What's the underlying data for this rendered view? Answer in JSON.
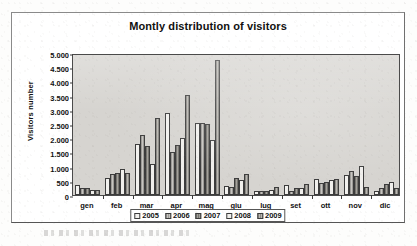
{
  "chart_data": {
    "type": "bar",
    "title": "Montly distribution of visitors",
    "xlabel": "",
    "ylabel": "Visitors number",
    "ylim": [
      0,
      5000
    ],
    "ytick_labels": [
      "0",
      "500",
      "1.000",
      "1.500",
      "2.000",
      "2.500",
      "3.000",
      "3.500",
      "4.000",
      "4.500",
      "5.000"
    ],
    "ytick_values": [
      0,
      500,
      1000,
      1500,
      2000,
      2500,
      3000,
      3500,
      4000,
      4500,
      5000
    ],
    "grid": false,
    "legend_position": "bottom",
    "categories": [
      "gen",
      "feb",
      "mar",
      "apr",
      "mag",
      "giu",
      "lug",
      "set",
      "ott",
      "nov",
      "dic"
    ],
    "series": [
      {
        "name": "2005",
        "values": [
          350,
          610,
          1800,
          2880,
          2530,
          300,
          140,
          340,
          570,
          690,
          150
        ]
      },
      {
        "name": "2006",
        "values": [
          250,
          730,
          2110,
          1530,
          2540,
          270,
          130,
          150,
          410,
          860,
          240
        ]
      },
      {
        "name": "2007",
        "values": [
          260,
          790,
          1710,
          1760,
          2490,
          590,
          140,
          230,
          470,
          670,
          390
        ]
      },
      {
        "name": "2008",
        "values": [
          160,
          930,
          1080,
          2010,
          1920,
          530,
          170,
          240,
          520,
          1020,
          450
        ]
      },
      {
        "name": "2009",
        "values": [
          180,
          770,
          2720,
          3520,
          4750,
          750,
          290,
          400,
          560,
          290,
          260
        ]
      }
    ]
  },
  "legend": {
    "items": [
      {
        "label": "2005"
      },
      {
        "label": "2006"
      },
      {
        "label": "2007"
      },
      {
        "label": "2008"
      },
      {
        "label": "2009"
      }
    ]
  },
  "colors": {
    "plot_background": "#d6d4d0",
    "frame_border": "#8a8a8a",
    "axis": "#3a3a3a",
    "series_2005": "#f2f1ee",
    "series_2006": "#b4b2ae",
    "series_2007": "#8e8c88",
    "series_2008": "#f0efec",
    "series_2009": "#a5a39f"
  }
}
